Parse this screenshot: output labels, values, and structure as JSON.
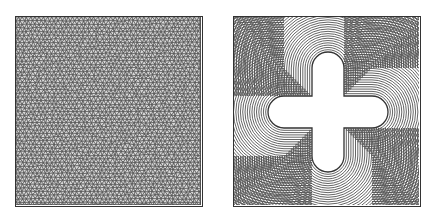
{
  "figure": {
    "panels": [
      {
        "id": "left",
        "description": "Fine triangular mesh filling a square domain",
        "type": "triangular-mesh"
      },
      {
        "id": "right",
        "description": "Concentric offset contour lines around a cross-shaped (plus) hole inside a square",
        "type": "offset-contours"
      }
    ],
    "colors": {
      "line": "#333333",
      "background": "#ffffff",
      "mesh_fill": "#9a9a9a"
    }
  }
}
